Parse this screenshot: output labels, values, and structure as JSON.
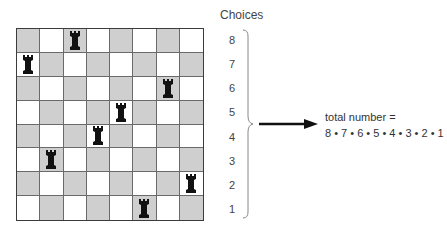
{
  "title": "Choices",
  "board": {
    "size": 8,
    "light_color": "#ffffff",
    "dark_color": "#cfcfcf",
    "top_left_square": "dark",
    "rooks": [
      {
        "row": 1,
        "col": 3
      },
      {
        "row": 2,
        "col": 1
      },
      {
        "row": 3,
        "col": 7
      },
      {
        "row": 4,
        "col": 5
      },
      {
        "row": 5,
        "col": 4
      },
      {
        "row": 6,
        "col": 2
      },
      {
        "row": 7,
        "col": 8
      },
      {
        "row": 8,
        "col": 6
      }
    ]
  },
  "choices": [
    "8",
    "7",
    "6",
    "5",
    "4",
    "3",
    "2",
    "1"
  ],
  "total": {
    "line1": "total number =",
    "line2": "8 • 7 • 6 • 5 • 4 • 3 • 2 • 1"
  }
}
